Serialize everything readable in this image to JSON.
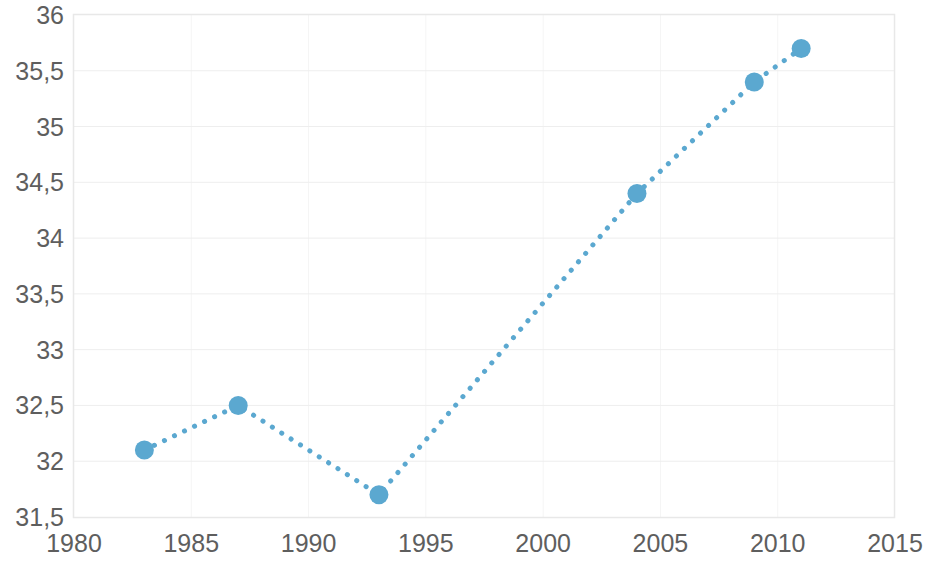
{
  "chart_data": {
    "type": "line",
    "title": "",
    "subtitle": "",
    "xlabel": "",
    "ylabel": "",
    "xlim": [
      1980,
      2015
    ],
    "ylim": [
      31.5,
      36
    ],
    "grid": true,
    "legend": null,
    "legend_position": "none",
    "line_style": "dotted",
    "marker": "circle",
    "series": [
      {
        "name": "",
        "color": "#5ba8d0",
        "x": [
          1983,
          1987,
          1993,
          2004,
          2009,
          2011
        ],
        "values": [
          32.1,
          32.5,
          31.7,
          34.4,
          35.4,
          35.7
        ],
        "points": [
          {
            "x": 1983,
            "y": 32.1
          },
          {
            "x": 1987,
            "y": 32.5
          },
          {
            "x": 1993,
            "y": 31.7
          },
          {
            "x": 2004,
            "y": 34.4
          },
          {
            "x": 2009,
            "y": 35.4
          },
          {
            "x": 2011,
            "y": 35.7
          }
        ]
      }
    ],
    "x_ticks": [
      1980,
      1985,
      1990,
      1995,
      2000,
      2005,
      2010,
      2015
    ],
    "x_tick_labels": [
      "1980",
      "1985",
      "1990",
      "1995",
      "2000",
      "2005",
      "2010",
      "2015"
    ],
    "y_ticks": [
      31.5,
      32,
      32.5,
      33,
      33.5,
      34,
      34.5,
      35,
      35.5,
      36
    ],
    "y_tick_labels": [
      "31,5",
      "32",
      "32,5",
      "33",
      "33,5",
      "34",
      "34,5",
      "35",
      "35,5",
      "36"
    ],
    "colors": {
      "series": "#5ba8d0",
      "grid_horizontal": "#eeeeee",
      "grid_vertical": "#f5f5f5",
      "plot_border": "#e8e8e8",
      "tick_label": "#5e5e5e",
      "background": "#ffffff"
    }
  }
}
